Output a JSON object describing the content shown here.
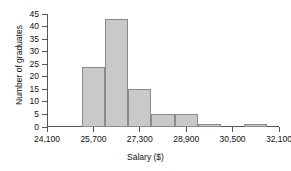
{
  "chart_data": {
    "type": "bar",
    "title": "",
    "xlabel": "Salary ($)",
    "ylabel": "Number of graduates",
    "grid": false,
    "legend": false,
    "bin_width": 800,
    "xlim": [
      24100,
      32100
    ],
    "ylim": [
      0,
      45
    ],
    "ytick_labels": [
      "0",
      "5",
      "10",
      "15",
      "20",
      "25",
      "30",
      "35",
      "40",
      "45"
    ],
    "ytick_values": [
      0,
      5,
      10,
      15,
      20,
      25,
      30,
      35,
      40,
      45
    ],
    "xtick_labels": [
      "24,100",
      "25,700",
      "27,300",
      "28,900",
      "30,500",
      "32,100"
    ],
    "xtick_values": [
      24100,
      25700,
      27300,
      28900,
      30500,
      32100
    ],
    "bins": [
      {
        "left": 25300,
        "right": 26100,
        "value": 24
      },
      {
        "left": 26100,
        "right": 26900,
        "value": 43
      },
      {
        "left": 26900,
        "right": 27700,
        "value": 15
      },
      {
        "left": 27700,
        "right": 28500,
        "value": 5
      },
      {
        "left": 28500,
        "right": 29300,
        "value": 5
      },
      {
        "left": 29300,
        "right": 30100,
        "value": 1
      },
      {
        "left": 30900,
        "right": 31700,
        "value": 1
      }
    ],
    "categories": [
      "25,300-26,100",
      "26,100-26,900",
      "26,900-27,700",
      "27,700-28,500",
      "28,500-29,300",
      "29,300-30,100",
      "30,900-31,700"
    ],
    "values": [
      24,
      43,
      15,
      5,
      5,
      1,
      1
    ],
    "colors": {
      "bar_fill": "#c9c9c9",
      "bar_edge": "#8a8a8a",
      "axis": "#555555",
      "text": "#111111",
      "background": "#ffffff"
    }
  }
}
